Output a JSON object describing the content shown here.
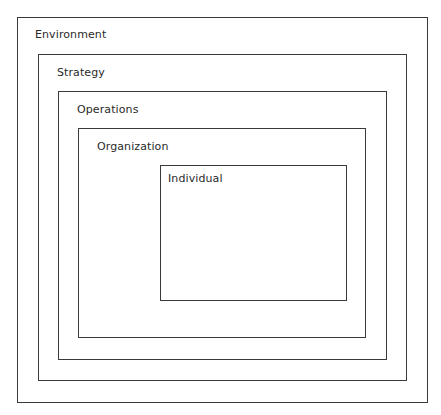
{
  "diagram": {
    "type": "nested-boxes",
    "line_color": "#3a3a3a",
    "text_color": "#2a2a2a",
    "levels": [
      {
        "label": "Environment",
        "box": {
          "x": 17,
          "y": 17,
          "w": 411,
          "h": 386
        },
        "label_pos": {
          "x": 35,
          "y": 28
        }
      },
      {
        "label": "Strategy",
        "box": {
          "x": 38,
          "y": 54,
          "w": 369,
          "h": 327
        },
        "label_pos": {
          "x": 57,
          "y": 66
        }
      },
      {
        "label": "Operations",
        "box": {
          "x": 58,
          "y": 91,
          "w": 329,
          "h": 269
        },
        "label_pos": {
          "x": 77,
          "y": 103
        }
      },
      {
        "label": "Organization",
        "box": {
          "x": 78,
          "y": 128,
          "w": 288,
          "h": 210
        },
        "label_pos": {
          "x": 97,
          "y": 140
        }
      },
      {
        "label": "Individual",
        "box": {
          "x": 160,
          "y": 165,
          "w": 187,
          "h": 136
        },
        "label_pos": {
          "x": 168,
          "y": 172
        }
      }
    ]
  }
}
